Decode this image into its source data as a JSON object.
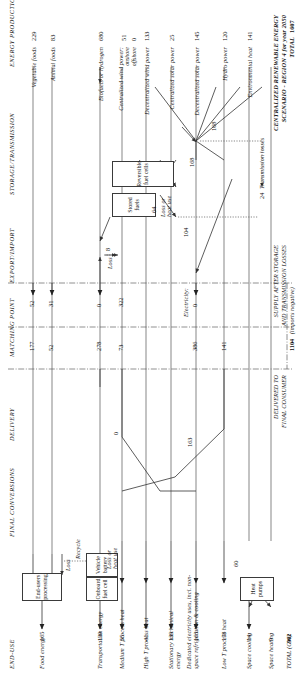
{
  "title": {
    "line1": "CENTRALIZED RENEWABLE ENERGY",
    "line2": "SCENARIO - REGION 4 for year 2050",
    "total_label": "TOTAL",
    "total_value": "1607"
  },
  "columns": [
    {
      "id": "energy-production",
      "label": "ENERGY PRODUCTION"
    },
    {
      "id": "storage-transmission",
      "label": "STORAGE/TRANSMISSION"
    },
    {
      "id": "export-import",
      "label": "EXPORT/IMPORT"
    },
    {
      "id": "matching-point",
      "label": "MATCHING POINT"
    },
    {
      "id": "delivery",
      "label": "DELIVERY"
    },
    {
      "id": "final-conversions",
      "label": "FINAL CONVERSIONS"
    },
    {
      "id": "end-use",
      "label": "END-USE"
    }
  ],
  "production": [
    {
      "label": "Vegetable foods",
      "value": "229"
    },
    {
      "label": "Animal foods",
      "value": "83"
    },
    {
      "label": "Biofuels or hydrogen",
      "value": "680"
    },
    {
      "label": "Centralized wind power:",
      "value": ""
    },
    {
      "label": "onshore",
      "value": "51"
    },
    {
      "label": "offshore",
      "value": "0"
    },
    {
      "label": "Decentralized wind power",
      "value": "133"
    },
    {
      "label": "Centralized solar power",
      "value": "25"
    },
    {
      "label": "Decentralized solar power",
      "value": "145"
    },
    {
      "label": "Hydro power",
      "value": "120"
    },
    {
      "label": "Environmental heat",
      "value": "141"
    }
  ],
  "end_use": [
    {
      "label": "Food energy",
      "value": "165"
    },
    {
      "label": "Transportation energy",
      "value": "139"
    },
    {
      "label": "Medium T process heat",
      "value": "55"
    },
    {
      "label": "High T process heat",
      "value": "41"
    },
    {
      "label": "Stationary mechanical energy",
      "value": "139"
    },
    {
      "label": "Dedicated electricity uses, incl. non-space refrigeration & cooling",
      "value": "163"
    },
    {
      "label": "Low T process heat",
      "value": "178"
    },
    {
      "label": "Space cooling",
      "value": "14"
    },
    {
      "label": "Space heating",
      "value": "9"
    },
    {
      "label": "TOTAL (GW)",
      "value": "902"
    }
  ],
  "conversion_boxes": [
    {
      "id": "end-users-processing",
      "label": "End-users processing"
    },
    {
      "id": "onboard-fuel-cell",
      "label": "Onboard fuel cell"
    },
    {
      "id": "vehicle-battery",
      "label": "Vehicle battery"
    },
    {
      "id": "heat-pumps",
      "label": "Heat pumps"
    }
  ],
  "storage_boxes": [
    {
      "id": "stored-fuels",
      "label": "Stored fuels"
    },
    {
      "id": "reversible-fuel-cells",
      "label": "Reversible fuel cells"
    }
  ],
  "export_import_values": [
    "52",
    "31",
    "0",
    "322",
    "0"
  ],
  "matching_point_values": [
    "177",
    "52",
    "278",
    "73",
    "386",
    "141"
  ],
  "annotations": {
    "loss": "Loss",
    "recycle": "Recycle",
    "loss_or_heat_use": "Loss or heat use",
    "loss_8": "8",
    "loss_64": "64",
    "electricity": "Electricity:",
    "transmission_losses": "Transmission losses",
    "transmission_losses_value": "24",
    "supply_after_storage_l1": "SUPPLY AFTER STORAGE",
    "supply_after_storage_l2": "AND TRANSMISSION LOSSES",
    "imports_negative": "(imports negative)",
    "delivered_l1": "DELIVERED TO",
    "delivered_l2": "FINAL CONSUMER",
    "delivered_value": "1104",
    "flow_168a": "168",
    "flow_168b": "168",
    "flow_104": "104",
    "flow_163": "163",
    "flow_0": "0",
    "flow_60": "60"
  },
  "colors": {
    "ink": "#1a1a1a",
    "line": "#555555",
    "box_border": "#3a3a3a",
    "background": "#ffffff"
  }
}
